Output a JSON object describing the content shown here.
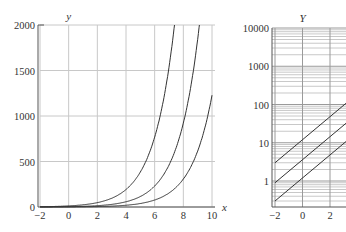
{
  "chart_data": [
    {
      "type": "line",
      "title": "",
      "xlabel": "x",
      "ylabel": "y",
      "xlim": [
        -2,
        10
      ],
      "ylim": [
        0,
        2000
      ],
      "xticks": [
        -2,
        0,
        2,
        4,
        6,
        8,
        10
      ],
      "yticks": [
        0,
        500,
        1000,
        1500,
        2000
      ],
      "grid": true,
      "yscale": "linear",
      "series": [
        {
          "name": "curve-1",
          "coef": 12,
          "base": 2
        },
        {
          "name": "curve-2",
          "coef": 3.6,
          "base": 2
        },
        {
          "name": "curve-3",
          "coef": 1.2,
          "base": 2
        }
      ]
    },
    {
      "type": "line",
      "title": "",
      "xlabel": "",
      "ylabel": "Y",
      "xlim": [
        -2,
        3.5
      ],
      "ylim": [
        0.2,
        10000
      ],
      "xticks": [
        -2,
        0,
        2
      ],
      "yticks": [
        1,
        10,
        100,
        1000,
        10000
      ],
      "ytick_labels": [
        "1",
        "10",
        "100",
        "1000",
        "10000"
      ],
      "grid": true,
      "yscale": "log",
      "series": [
        {
          "name": "line-1",
          "coef": 12,
          "base": 2
        },
        {
          "name": "line-2",
          "coef": 3.6,
          "base": 2
        },
        {
          "name": "line-3",
          "coef": 1.2,
          "base": 2
        }
      ]
    }
  ],
  "labels": {
    "left_ylabel": "y",
    "left_xlabel": "x",
    "right_ylabel": "Y"
  }
}
